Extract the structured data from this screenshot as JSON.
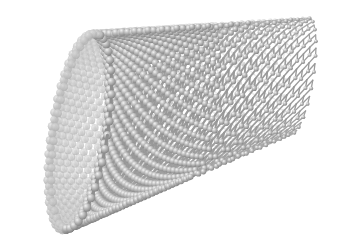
{
  "figure": {
    "kind": "molecular-structure-render",
    "subject_name": "single-walled carbon nanotube",
    "render_style": "ball-and-stick",
    "color_mode": "grayscale",
    "background_color": "#ffffff",
    "atom_color": "#9a9a9a",
    "atom_highlight_color": "#e8e8e8",
    "atom_shadow_color": "#6a6a6a",
    "bond_color": "#a2a2a2",
    "bond_shadow_color": "#777777",
    "width_px": 342,
    "height_px": 247,
    "labels": [],
    "annotations": []
  },
  "geometry": {
    "description": "open-ended cylinder seen obliquely, near rim at lower-left, tube receding to upper-right",
    "axis_start_x": 78,
    "axis_start_y": 132,
    "axis_end_x": 300,
    "axis_end_y": 76,
    "near_radius_x": 26,
    "near_radius_y": 98,
    "far_radius_x": 13,
    "far_radius_y": 58,
    "rings_along_axis": 46,
    "atoms_per_ring": 44,
    "chiral_twist_deg": 10,
    "near_atom_radius": 4.2,
    "far_atom_radius": 1.9,
    "near_bond_width": 3.0,
    "far_bond_width": 1.3
  },
  "shading": {
    "light_direction": "upper-left",
    "front_wall_opacity": 0.95,
    "back_wall_opacity": 0.42,
    "rim_emphasis": true
  },
  "chart_data": {
    "type": "scatter",
    "title": "",
    "xlabel": "",
    "ylabel": "",
    "categories": [],
    "values": []
  }
}
